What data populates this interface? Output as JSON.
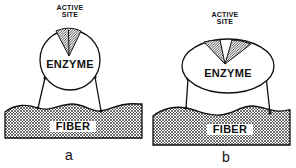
{
  "figure": {
    "panels": [
      {
        "id": "a",
        "caption": "a",
        "enzyme_shape": "circle",
        "active_site_label_line1": "ACTIVE",
        "active_site_label_line2": "SITE",
        "active_site_state": "narrow cleft",
        "enzyme_label": "ENZYME",
        "fiber_label": "FIBER"
      },
      {
        "id": "b",
        "caption": "b",
        "enzyme_shape": "ellipse (flattened)",
        "active_site_label_line1": "ACTIVE",
        "active_site_label_line2": "SITE",
        "active_site_state": "opened cleft",
        "enzyme_label": "ENZYME",
        "fiber_label": "FIBER"
      }
    ],
    "colors": {
      "line": "#111111",
      "background": "#ffffff",
      "hatch": "#222222"
    }
  }
}
